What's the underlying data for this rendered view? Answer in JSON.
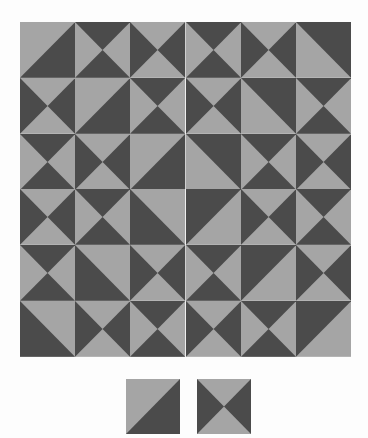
{
  "colors": {
    "light": "#a5a5a5",
    "dark": "#4b4b4b",
    "background": "#fdfdfd"
  },
  "tile_types": {
    "H": "hourglass dark top and bottom",
    "V": "hourglass dark left and right",
    "A": "diagonal light top-left, dark bottom-right",
    "B": "diagonal dark top-right, light bottom-left",
    "C": "diagonal dark bottom-left, light top-right",
    "D": "diagonal dark top-left, light bottom-right"
  },
  "grid": {
    "rows": 6,
    "cols": 6,
    "cells": [
      [
        "A",
        "H",
        "V",
        "H",
        "V",
        "B"
      ],
      [
        "V",
        "A",
        "H",
        "V",
        "B",
        "H"
      ],
      [
        "H",
        "V",
        "A",
        "B",
        "H",
        "V"
      ],
      [
        "V",
        "H",
        "C",
        "D",
        "V",
        "H"
      ],
      [
        "H",
        "C",
        "V",
        "H",
        "D",
        "V"
      ],
      [
        "C",
        "V",
        "H",
        "V",
        "H",
        "D"
      ]
    ]
  },
  "answer_options": [
    {
      "label": "option-1",
      "type": "A"
    },
    {
      "label": "option-2",
      "type": "V"
    }
  ]
}
